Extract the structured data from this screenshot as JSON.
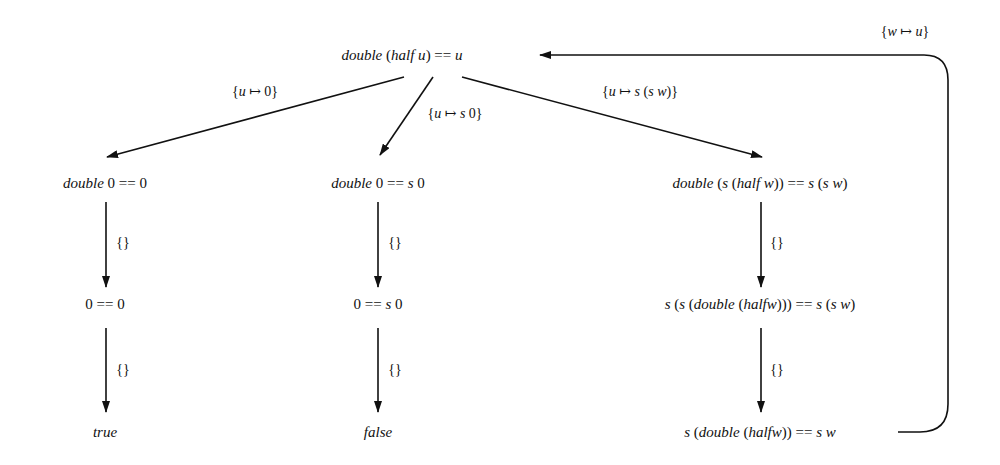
{
  "diagram": {
    "type": "narrowing-tree",
    "nodes": [
      {
        "id": "root",
        "parts": [
          {
            "t": "double",
            "i": true
          },
          {
            "t": " (",
            "i": false
          },
          {
            "t": "half u",
            "i": true
          },
          {
            "t": ") == ",
            "i": false
          },
          {
            "t": "u",
            "i": true
          }
        ],
        "x": 402,
        "y": 55
      },
      {
        "id": "l1",
        "parts": [
          {
            "t": "double",
            "i": true
          },
          {
            "t": " 0 == 0",
            "i": false
          }
        ],
        "x": 105,
        "y": 183
      },
      {
        "id": "m1",
        "parts": [
          {
            "t": "double",
            "i": true
          },
          {
            "t": " 0 == ",
            "i": false
          },
          {
            "t": "s",
            "i": true
          },
          {
            "t": " 0",
            "i": false
          }
        ],
        "x": 378,
        "y": 183
      },
      {
        "id": "r1",
        "parts": [
          {
            "t": "double",
            "i": true
          },
          {
            "t": " (",
            "i": false
          },
          {
            "t": "s",
            "i": true
          },
          {
            "t": " (",
            "i": false
          },
          {
            "t": "half w",
            "i": true
          },
          {
            "t": ")) == ",
            "i": false
          },
          {
            "t": "s",
            "i": true
          },
          {
            "t": " (",
            "i": false
          },
          {
            "t": "s w",
            "i": true
          },
          {
            "t": ")",
            "i": false
          }
        ],
        "x": 760,
        "y": 183
      },
      {
        "id": "l2",
        "parts": [
          {
            "t": "0 == 0",
            "i": false
          }
        ],
        "x": 105,
        "y": 304
      },
      {
        "id": "m2",
        "parts": [
          {
            "t": "0 == ",
            "i": false
          },
          {
            "t": "s",
            "i": true
          },
          {
            "t": " 0",
            "i": false
          }
        ],
        "x": 378,
        "y": 304
      },
      {
        "id": "r2",
        "parts": [
          {
            "t": "s",
            "i": true
          },
          {
            "t": " (",
            "i": false
          },
          {
            "t": "s",
            "i": true
          },
          {
            "t": " (",
            "i": false
          },
          {
            "t": "double",
            "i": true
          },
          {
            "t": " (",
            "i": false
          },
          {
            "t": "halfw",
            "i": true
          },
          {
            "t": "))) == ",
            "i": false
          },
          {
            "t": "s",
            "i": true
          },
          {
            "t": " (",
            "i": false
          },
          {
            "t": "s w",
            "i": true
          },
          {
            "t": ")",
            "i": false
          }
        ],
        "x": 760,
        "y": 304
      },
      {
        "id": "l3",
        "parts": [
          {
            "t": "true",
            "i": true
          }
        ],
        "x": 105,
        "y": 432
      },
      {
        "id": "m3",
        "parts": [
          {
            "t": "false",
            "i": true
          }
        ],
        "x": 378,
        "y": 432
      },
      {
        "id": "r3",
        "parts": [
          {
            "t": "s",
            "i": true
          },
          {
            "t": " (",
            "i": false
          },
          {
            "t": "double",
            "i": true
          },
          {
            "t": " (",
            "i": false
          },
          {
            "t": "halfw",
            "i": true
          },
          {
            "t": ")) == ",
            "i": false
          },
          {
            "t": "s w",
            "i": true
          }
        ],
        "x": 760,
        "y": 432
      }
    ],
    "edge_labels": [
      {
        "id": "root-l1",
        "parts": [
          {
            "t": "{",
            "i": false
          },
          {
            "t": "u",
            "i": true
          },
          {
            "t": " ↦ 0}",
            "i": false
          }
        ],
        "x": 255,
        "y": 92
      },
      {
        "id": "root-m1",
        "parts": [
          {
            "t": "{",
            "i": false
          },
          {
            "t": "u",
            "i": true
          },
          {
            "t": " ↦ ",
            "i": false
          },
          {
            "t": "s",
            "i": true
          },
          {
            "t": " 0}",
            "i": false
          }
        ],
        "x": 455,
        "y": 114
      },
      {
        "id": "root-r1",
        "parts": [
          {
            "t": "{",
            "i": false
          },
          {
            "t": "u",
            "i": true
          },
          {
            "t": " ↦ ",
            "i": false
          },
          {
            "t": "s",
            "i": true
          },
          {
            "t": " (",
            "i": false
          },
          {
            "t": "s w",
            "i": true
          },
          {
            "t": ")}",
            "i": false
          }
        ],
        "x": 640,
        "y": 92
      },
      {
        "id": "l1-l2",
        "parts": [
          {
            "t": "{}",
            "i": false
          }
        ],
        "x": 123,
        "y": 243
      },
      {
        "id": "m1-m2",
        "parts": [
          {
            "t": "{}",
            "i": false
          }
        ],
        "x": 395,
        "y": 243
      },
      {
        "id": "r1-r2",
        "parts": [
          {
            "t": "{}",
            "i": false
          }
        ],
        "x": 777,
        "y": 243
      },
      {
        "id": "l2-l3",
        "parts": [
          {
            "t": "{}",
            "i": false
          }
        ],
        "x": 123,
        "y": 370
      },
      {
        "id": "m2-m3",
        "parts": [
          {
            "t": "{}",
            "i": false
          }
        ],
        "x": 395,
        "y": 370
      },
      {
        "id": "r2-r3",
        "parts": [
          {
            "t": "{}",
            "i": false
          }
        ],
        "x": 777,
        "y": 370
      },
      {
        "id": "r3-root",
        "parts": [
          {
            "t": "{",
            "i": false
          },
          {
            "t": "w",
            "i": true
          },
          {
            "t": " ↦ ",
            "i": false
          },
          {
            "t": "u",
            "i": true
          },
          {
            "t": "}",
            "i": false
          }
        ],
        "x": 905,
        "y": 32
      }
    ],
    "edges": [
      {
        "from": "root",
        "to": "l1",
        "label": "{u ↦ 0}"
      },
      {
        "from": "root",
        "to": "m1",
        "label": "{u ↦ s 0}"
      },
      {
        "from": "root",
        "to": "r1",
        "label": "{u ↦ s (s w)}"
      },
      {
        "from": "l1",
        "to": "l2",
        "label": "{}"
      },
      {
        "from": "m1",
        "to": "m2",
        "label": "{}"
      },
      {
        "from": "r1",
        "to": "r2",
        "label": "{}"
      },
      {
        "from": "l2",
        "to": "l3",
        "label": "{}"
      },
      {
        "from": "m2",
        "to": "m3",
        "label": "{}"
      },
      {
        "from": "r2",
        "to": "r3",
        "label": "{}"
      },
      {
        "from": "r3",
        "to": "root",
        "label": "{w ↦ u}"
      }
    ],
    "colors": {
      "stroke": "#111111",
      "background": "#ffffff"
    }
  }
}
